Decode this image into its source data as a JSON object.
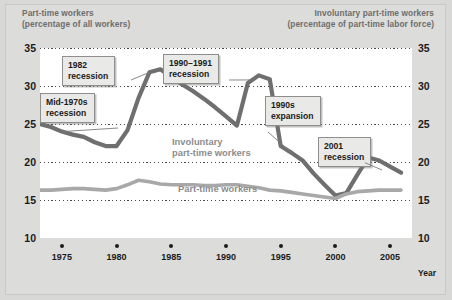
{
  "header": {
    "left_line1": "Part-time workers",
    "left_line2": "(percentage of all workers)",
    "right_line1": "Involuntary part-time workers",
    "right_line2": "(percentage of part-time labor force)"
  },
  "annotations": [
    {
      "id": "mid-1970s-recession",
      "line1": "Mid-1970s",
      "line2": "recession"
    },
    {
      "id": "1982-recession",
      "line1": "1982",
      "line2": "recession"
    },
    {
      "id": "1990-1991-recession",
      "line1": "1990–1991",
      "line2": "recession"
    },
    {
      "id": "1990s-expansion",
      "line1": "1990s",
      "line2": "expansion"
    },
    {
      "id": "2001-recession",
      "line1": "2001",
      "line2": "recession"
    }
  ],
  "series_labels": {
    "involuntary_line1": "Involuntary",
    "involuntary_line2": "part-time workers",
    "parttime": "Part-time workers"
  },
  "colors": {
    "involuntary_line": "#6f6f6f",
    "parttime_line": "#a8a8a8",
    "gridline": "#4a4a4a",
    "plot_background": "#ffffff",
    "figure_background": "#d8d8d6",
    "callout_background": "#e9e9e7",
    "callout_border": "#8e8e8c",
    "header_text": "#6e6e6e",
    "axis_text": "#1b1b1b"
  },
  "chart_data": {
    "type": "line",
    "title": "",
    "xlabel": "Year",
    "ylabel": "",
    "xlim": [
      1973,
      2007
    ],
    "ylim": [
      10,
      35
    ],
    "yticks": [
      10,
      15,
      20,
      25,
      30,
      35
    ],
    "ytick_labels_left": [
      "10",
      "15",
      "20",
      "25",
      "30",
      "35"
    ],
    "ytick_labels_right": [
      "10",
      "15",
      "20",
      "25",
      "30",
      "35"
    ],
    "xticks": [
      1975,
      1980,
      1985,
      1990,
      1995,
      2000,
      2005
    ],
    "xtick_labels": [
      "1975",
      "1980",
      "1985",
      "1990",
      "1995",
      "2000",
      "2005"
    ],
    "grid": "horizontal-dotted",
    "legend": "inline-labels",
    "x": [
      1973,
      1974,
      1975,
      1976,
      1977,
      1978,
      1979,
      1980,
      1981,
      1982,
      1983,
      1984,
      1985,
      1986,
      1987,
      1988,
      1989,
      1990,
      1991,
      1992,
      1993,
      1994,
      1995,
      1996,
      1997,
      1998,
      1999,
      2000,
      2001,
      2002,
      2003,
      2004,
      2005,
      2006
    ],
    "series": [
      {
        "name": "Involuntary part-time workers",
        "axis": "right",
        "color": "#6f6f6f",
        "values": [
          25.0,
          24.6,
          24.0,
          23.6,
          23.3,
          22.6,
          22.1,
          22.1,
          24.2,
          28.4,
          31.8,
          32.2,
          31.2,
          30.2,
          29.3,
          28.3,
          27.2,
          26.0,
          24.8,
          30.4,
          31.4,
          30.9,
          22.1,
          21.2,
          20.2,
          18.5,
          17.0,
          15.6,
          15.9,
          18.3,
          20.6,
          20.2,
          19.4,
          18.6
        ]
      },
      {
        "name": "Part-time workers",
        "axis": "left",
        "color": "#a8a8a8",
        "values": [
          16.3,
          16.3,
          16.4,
          16.5,
          16.5,
          16.4,
          16.3,
          16.5,
          17.0,
          17.6,
          17.4,
          17.1,
          17.0,
          17.0,
          17.0,
          16.9,
          16.9,
          17.0,
          17.0,
          16.8,
          16.6,
          16.3,
          16.2,
          16.0,
          15.8,
          15.6,
          15.4,
          15.2,
          15.8,
          16.1,
          16.2,
          16.3,
          16.3,
          16.3
        ]
      }
    ]
  }
}
